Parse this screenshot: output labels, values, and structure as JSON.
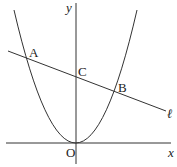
{
  "diagram": {
    "axes": {
      "x_label": "x",
      "y_label": "y",
      "origin_label": "O"
    },
    "points": {
      "A": "A",
      "B": "B",
      "C": "C"
    },
    "line_label": "ℓ",
    "curve": "parabola y = ax^2 through origin",
    "colors": {
      "stroke": "#333333",
      "background": "#ffffff"
    }
  }
}
